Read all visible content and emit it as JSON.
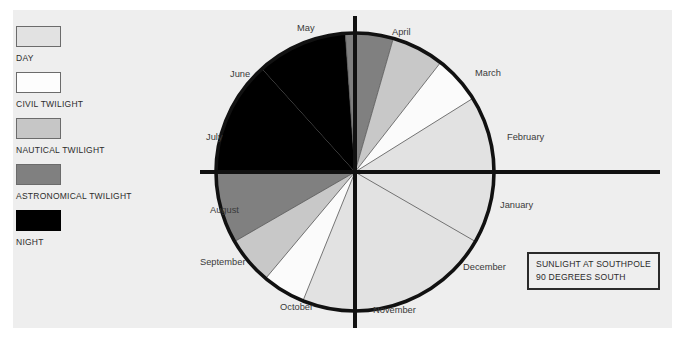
{
  "page": {
    "background": "#ffffff",
    "panel_background": "#eeeeee"
  },
  "legend": {
    "items": [
      {
        "label": "DAY",
        "color": "#e2e2e2",
        "border": "#6b6b6b"
      },
      {
        "label": "CIVIL TWILIGHT",
        "color": "#fdfdfd",
        "border": "#6b6b6b"
      },
      {
        "label": "NAUTICAL TWILIGHT",
        "color": "#c6c6c6",
        "border": "#6b6b6b"
      },
      {
        "label": "ASTRONOMICAL TWILIGHT",
        "color": "#808080",
        "border": "#6b6b6b"
      },
      {
        "label": "NIGHT",
        "color": "#000000",
        "border": "#000000"
      }
    ]
  },
  "caption": {
    "line1": "SUNLIGHT AT SOUTHPOLE",
    "line2": "90 DEGREES SOUTH"
  },
  "chart_data": {
    "type": "pie",
    "title": "SUNLIGHT AT SOUTHPOLE 90 DEGREES SOUTH",
    "center": [
      155,
      172
    ],
    "radius": 139,
    "axis": {
      "vertical": true,
      "horizontal": true,
      "color": "#111111",
      "width": 4
    },
    "outline": {
      "color": "#111111",
      "width": 3.5
    },
    "month_labels": [
      {
        "name": "January",
        "x": 300,
        "y": 208
      },
      {
        "name": "February",
        "x": 307,
        "y": 140
      },
      {
        "name": "March",
        "x": 275,
        "y": 76
      },
      {
        "name": "April",
        "x": 192,
        "y": 35
      },
      {
        "name": "May",
        "x": 97,
        "y": 31
      },
      {
        "name": "June",
        "x": 30,
        "y": 77
      },
      {
        "name": "July",
        "x": 6,
        "y": 140
      },
      {
        "name": "August",
        "x": 10,
        "y": 213
      },
      {
        "name": "September",
        "x": 0,
        "y": 265
      },
      {
        "name": "October",
        "x": 80,
        "y": 310
      },
      {
        "name": "November",
        "x": 173,
        "y": 313
      },
      {
        "name": "December",
        "x": 263,
        "y": 270
      }
    ],
    "categories": [
      "DAY",
      "CIVIL TWILIGHT",
      "NAUTICAL TWILIGHT",
      "ASTRONOMICAL TWILIGHT",
      "NIGHT"
    ],
    "colors": {
      "DAY": "#e2e2e2",
      "CIVIL TWILIGHT": "#fbfbfb",
      "NAUTICAL TWILIGHT": "#c8c8c8",
      "ASTRONOMICAL TWILIGHT": "#808080",
      "NIGHT": "#000000"
    },
    "note": "Angles measured clockwise from 12 o'clock (top). Full year = 360 degrees.",
    "sectors": [
      {
        "category": "NIGHT",
        "start_deg": 318,
        "end_deg": 356,
        "color": "#000000"
      },
      {
        "category": "ASTRONOMICAL TWILIGHT",
        "start_deg": 356,
        "end_deg": 376,
        "color": "#808080"
      },
      {
        "category": "NAUTICAL TWILIGHT",
        "start_deg": 376,
        "end_deg": 398,
        "color": "#c8c8c8"
      },
      {
        "category": "CIVIL TWILIGHT",
        "start_deg": 398,
        "end_deg": 418,
        "color": "#fbfbfb"
      },
      {
        "category": "DAY",
        "start_deg": 418,
        "end_deg": 562,
        "color": "#e2e2e2"
      },
      {
        "category": "CIVIL TWILIGHT",
        "start_deg": 562,
        "end_deg": 580,
        "color": "#fbfbfb"
      },
      {
        "category": "NAUTICAL TWILIGHT",
        "start_deg": 580,
        "end_deg": 600,
        "color": "#c8c8c8"
      },
      {
        "category": "ASTRONOMICAL TWILIGHT",
        "start_deg": 600,
        "end_deg": 630,
        "color": "#808080"
      },
      {
        "category": "NIGHT",
        "start_deg": 630,
        "end_deg": 678,
        "color": "#000000"
      }
    ],
    "divider_lines_deg": [
      356,
      376,
      398,
      418,
      480,
      540,
      562,
      580,
      600,
      630
    ]
  }
}
